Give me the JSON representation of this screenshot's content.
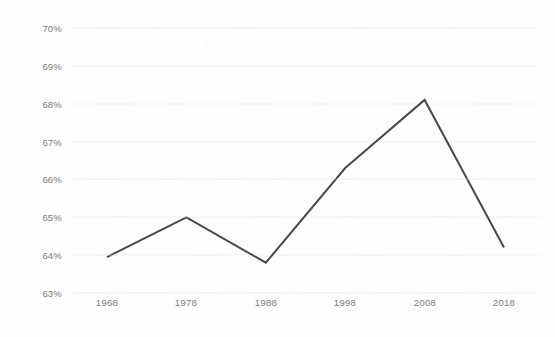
{
  "chart_data": {
    "type": "line",
    "title": "",
    "subtitle": "",
    "xlabel": "",
    "ylabel": "",
    "x": [
      1968,
      1978,
      1988,
      1998,
      2008,
      2018
    ],
    "categories": [
      "1968",
      "1978",
      "1988",
      "1998",
      "2008",
      "2018"
    ],
    "values": [
      63.95,
      65.0,
      63.8,
      66.3,
      68.1,
      64.2
    ],
    "series": [
      {
        "name": "",
        "values": [
          63.95,
          65.0,
          63.8,
          66.3,
          68.1,
          64.2
        ]
      }
    ],
    "y_tick_labels": [
      "70%",
      "69%",
      "68%",
      "67%",
      "66%",
      "65%",
      "64%",
      "63%"
    ],
    "y_ticks": [
      70,
      69,
      68,
      67,
      66,
      65,
      64,
      63
    ],
    "x_tick_labels": [
      "1968",
      "1978",
      "1988",
      "1998",
      "2008",
      "2018"
    ],
    "ylim": [
      63,
      70
    ],
    "xlim": [
      1968,
      2018
    ],
    "grid": true,
    "grid_axis": "y",
    "legend": false,
    "legend_position": "none",
    "annotations": [],
    "line_color": "#4a4a4a",
    "line_width": 2,
    "markers": false,
    "background_color": "#fdfdfd",
    "tick_label_color": "#7b7b7b",
    "gridline_color": "#f3f3f3"
  }
}
